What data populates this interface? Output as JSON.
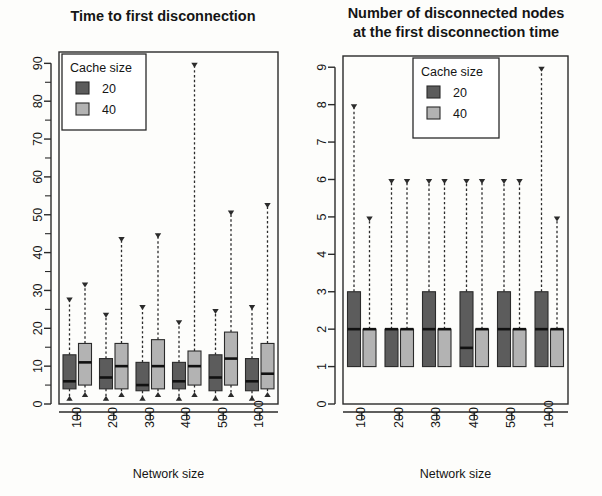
{
  "figure": {
    "width": 602,
    "height": 496,
    "background": "#fdfdfb"
  },
  "colors": {
    "cache20": "#5c5c5c",
    "cache40": "#b3b3b3",
    "axis": "#2a2a2a",
    "text": "#151515"
  },
  "chart_data": [
    {
      "id": "time-to-first-disconnection",
      "type": "box",
      "title": "Time to first disconnection",
      "xlabel": "Network size",
      "ylabel": "",
      "categories": [
        "100",
        "200",
        "300",
        "400",
        "500",
        "1000"
      ],
      "ylim": [
        0,
        93
      ],
      "yticks": [
        0,
        10,
        20,
        30,
        40,
        50,
        60,
        70,
        80,
        90
      ],
      "yticks_minor": [
        5,
        15,
        25,
        35,
        45,
        55,
        65,
        75,
        85
      ],
      "grid": false,
      "legend": {
        "title": "Cache size",
        "position": "top-left",
        "entries": [
          {
            "label": "20",
            "color": "#5c5c5c"
          },
          {
            "label": "40",
            "color": "#b3b3b3"
          }
        ]
      },
      "series": [
        {
          "name": "20",
          "color": "#5c5c5c",
          "boxes": [
            {
              "category": "100",
              "min": 1,
              "q1": 4,
              "median": 6,
              "q3": 13,
              "max": 28
            },
            {
              "category": "200",
              "min": 1,
              "q1": 4,
              "median": 7,
              "q3": 12,
              "max": 24
            },
            {
              "category": "300",
              "min": 1,
              "q1": 3.5,
              "median": 5,
              "q3": 11,
              "max": 26
            },
            {
              "category": "400",
              "min": 1,
              "q1": 4,
              "median": 6,
              "q3": 11,
              "max": 22
            },
            {
              "category": "500",
              "min": 1,
              "q1": 3.5,
              "median": 7,
              "q3": 13,
              "max": 25
            },
            {
              "category": "1000",
              "min": 1,
              "q1": 3.5,
              "median": 6,
              "q3": 12,
              "max": 26
            }
          ]
        },
        {
          "name": "40",
          "color": "#b3b3b3",
          "boxes": [
            {
              "category": "100",
              "min": 2,
              "q1": 5,
              "median": 11,
              "q3": 16,
              "max": 32
            },
            {
              "category": "200",
              "min": 2,
              "q1": 4,
              "median": 10,
              "q3": 16,
              "max": 44
            },
            {
              "category": "300",
              "min": 2,
              "q1": 4,
              "median": 10,
              "q3": 17,
              "max": 45
            },
            {
              "category": "400",
              "min": 2,
              "q1": 5,
              "median": 10,
              "q3": 14,
              "max": 90
            },
            {
              "category": "500",
              "min": 2,
              "q1": 5,
              "median": 12,
              "q3": 19,
              "max": 51
            },
            {
              "category": "1000",
              "min": 2,
              "q1": 4,
              "median": 8,
              "q3": 16,
              "max": 53
            }
          ]
        }
      ]
    },
    {
      "id": "number-of-disconnected-nodes",
      "type": "box",
      "title": "Number of disconnected nodes\nat the first disconnection time",
      "title_line1": "Number of disconnected nodes",
      "title_line2": "at the first disconnection time",
      "xlabel": "Network size",
      "ylabel": "",
      "categories": [
        "100",
        "200",
        "300",
        "400",
        "500",
        "1000"
      ],
      "ylim": [
        0,
        9.3
      ],
      "yticks": [
        0,
        1,
        2,
        3,
        4,
        5,
        6,
        7,
        8,
        9
      ],
      "yticks_minor": [],
      "grid": false,
      "legend": {
        "title": "Cache size",
        "position": "top-center",
        "entries": [
          {
            "label": "20",
            "color": "#5c5c5c"
          },
          {
            "label": "40",
            "color": "#b3b3b3"
          }
        ]
      },
      "series": [
        {
          "name": "20",
          "color": "#5c5c5c",
          "boxes": [
            {
              "category": "100",
              "min": 1,
              "q1": 1,
              "median": 2,
              "q3": 3,
              "max": 8
            },
            {
              "category": "200",
              "min": 1,
              "q1": 1,
              "median": 2,
              "q3": 2,
              "max": 6
            },
            {
              "category": "300",
              "min": 1,
              "q1": 1,
              "median": 2,
              "q3": 3,
              "max": 6
            },
            {
              "category": "400",
              "min": 1,
              "q1": 1,
              "median": 1.5,
              "q3": 3,
              "max": 6
            },
            {
              "category": "500",
              "min": 1,
              "q1": 1,
              "median": 2,
              "q3": 3,
              "max": 6
            },
            {
              "category": "1000",
              "min": 1,
              "q1": 1,
              "median": 2,
              "q3": 3,
              "max": 9
            }
          ]
        },
        {
          "name": "40",
          "color": "#b3b3b3",
          "boxes": [
            {
              "category": "100",
              "min": 1,
              "q1": 1,
              "median": 2,
              "q3": 2,
              "max": 5
            },
            {
              "category": "200",
              "min": 1,
              "q1": 1,
              "median": 2,
              "q3": 2,
              "max": 6
            },
            {
              "category": "300",
              "min": 1,
              "q1": 1,
              "median": 2,
              "q3": 2,
              "max": 6
            },
            {
              "category": "400",
              "min": 1,
              "q1": 1,
              "median": 2,
              "q3": 2,
              "max": 6
            },
            {
              "category": "500",
              "min": 1,
              "q1": 1,
              "median": 2,
              "q3": 2,
              "max": 6
            },
            {
              "category": "1000",
              "min": 1,
              "q1": 1,
              "median": 2,
              "q3": 2,
              "max": 5
            }
          ]
        }
      ]
    }
  ]
}
